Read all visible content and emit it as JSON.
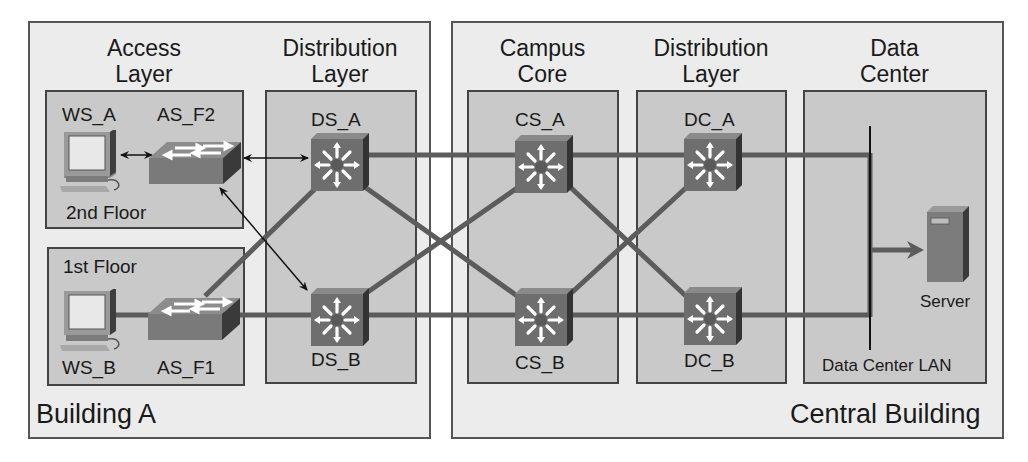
{
  "diagram": {
    "type": "hierarchical campus network topology",
    "colors": {
      "building_fill": "#ececec",
      "zone_fill": "#c9c9c9",
      "link": "#5c5c5c",
      "switch_face": "#6e6e6e",
      "switch_side": "#3a3a3a",
      "border": "#444444"
    }
  },
  "buildings": [
    {
      "id": "building-a",
      "label": "Building A"
    },
    {
      "id": "central-building",
      "label": "Central Building"
    }
  ],
  "layers": [
    {
      "id": "access",
      "title_line1": "Access",
      "title_line2": "Layer"
    },
    {
      "id": "distribution-a",
      "title_line1": "Distribution",
      "title_line2": "Layer"
    },
    {
      "id": "core",
      "title_line1": "Campus",
      "title_line2": "Core"
    },
    {
      "id": "distribution-c",
      "title_line1": "Distribution",
      "title_line2": "Layer"
    },
    {
      "id": "datacenter",
      "title_line1": "Data",
      "title_line2": "Center"
    }
  ],
  "floors": {
    "second": "2nd Floor",
    "first": "1st Floor"
  },
  "devices": {
    "ws_a": {
      "label": "WS_A",
      "kind": "workstation-icon"
    },
    "ws_b": {
      "label": "WS_B",
      "kind": "workstation-icon"
    },
    "as_f2": {
      "label": "AS_F2",
      "kind": "access-switch-icon"
    },
    "as_f1": {
      "label": "AS_F1",
      "kind": "access-switch-icon"
    },
    "ds_a": {
      "label": "DS_A",
      "kind": "multilayer-switch-icon"
    },
    "ds_b": {
      "label": "DS_B",
      "kind": "multilayer-switch-icon"
    },
    "cs_a": {
      "label": "CS_A",
      "kind": "multilayer-switch-icon"
    },
    "cs_b": {
      "label": "CS_B",
      "kind": "multilayer-switch-icon"
    },
    "dc_a": {
      "label": "DC_A",
      "kind": "multilayer-switch-icon"
    },
    "dc_b": {
      "label": "DC_B",
      "kind": "multilayer-switch-icon"
    },
    "server": {
      "label": "Server",
      "kind": "server-icon"
    }
  },
  "datacenter_lan_label": "Data Center LAN",
  "links": [
    {
      "from": "WS_A",
      "to": "AS_F2",
      "style": "double-arrow"
    },
    {
      "from": "AS_F2",
      "to": "DS_A",
      "style": "double-arrow"
    },
    {
      "from": "AS_F2",
      "to": "DS_B",
      "style": "double-arrow"
    },
    {
      "from": "WS_B",
      "to": "AS_F1",
      "style": "thick"
    },
    {
      "from": "AS_F1",
      "to": "DS_B",
      "style": "thick"
    },
    {
      "from": "AS_F1",
      "to": "DS_A",
      "style": "thick"
    },
    {
      "from": "DS_A",
      "to": "CS_A",
      "style": "thick"
    },
    {
      "from": "DS_A",
      "to": "CS_B",
      "style": "thick"
    },
    {
      "from": "DS_B",
      "to": "CS_B",
      "style": "thick"
    },
    {
      "from": "DS_B",
      "to": "CS_A",
      "style": "thick"
    },
    {
      "from": "CS_A",
      "to": "DC_A",
      "style": "thick"
    },
    {
      "from": "CS_A",
      "to": "DC_B",
      "style": "thick"
    },
    {
      "from": "CS_B",
      "to": "DC_B",
      "style": "thick"
    },
    {
      "from": "CS_B",
      "to": "DC_A",
      "style": "thick"
    },
    {
      "from": "DC_A",
      "to": "Data Center LAN",
      "style": "thick"
    },
    {
      "from": "DC_B",
      "to": "Data Center LAN",
      "style": "thick"
    },
    {
      "from": "Data Center LAN",
      "to": "Server",
      "style": "arrow"
    }
  ]
}
